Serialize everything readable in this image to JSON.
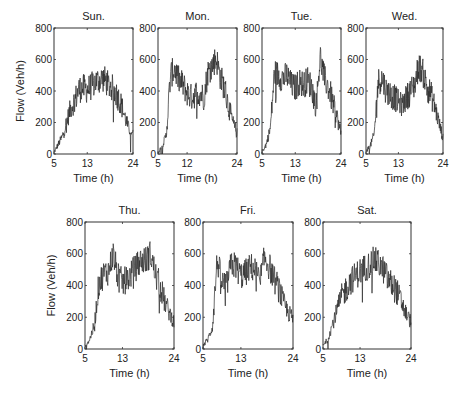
{
  "figure": {
    "ylabel": "Flow (Veh/h)",
    "xlabel": "Time (h)"
  },
  "chart_data": [
    {
      "type": "line",
      "title": "Sun.",
      "xlabel": "Time (h)",
      "ylabel": "Flow (Veh/h)",
      "xlim": [
        5,
        24
      ],
      "ylim": [
        0,
        800
      ],
      "xticks": [
        5,
        13,
        24
      ],
      "yticks": [
        0,
        200,
        400,
        600,
        800
      ],
      "grid": false,
      "x": [
        5,
        6,
        7,
        8,
        9,
        10,
        11,
        12,
        13,
        14,
        15,
        16,
        17,
        18,
        19,
        20,
        21,
        22,
        23,
        24
      ],
      "values": [
        10,
        60,
        110,
        200,
        290,
        340,
        410,
        420,
        410,
        430,
        460,
        470,
        480,
        440,
        420,
        380,
        330,
        240,
        160,
        140
      ]
    },
    {
      "type": "line",
      "title": "Mon.",
      "xlabel": "Time (h)",
      "ylabel": "",
      "xlim": [
        5,
        24
      ],
      "ylim": [
        0,
        800
      ],
      "xticks": [
        5,
        12,
        24
      ],
      "yticks": [
        0,
        200,
        400,
        600,
        800
      ],
      "grid": false,
      "x": [
        5,
        6,
        7,
        8,
        9,
        10,
        11,
        12,
        13,
        14,
        15,
        16,
        17,
        18,
        19,
        20,
        21,
        22,
        23,
        24
      ],
      "values": [
        10,
        50,
        120,
        500,
        540,
        470,
        440,
        390,
        360,
        380,
        390,
        360,
        520,
        560,
        610,
        490,
        420,
        300,
        200,
        130
      ]
    },
    {
      "type": "line",
      "title": "Tue.",
      "xlabel": "Time (h)",
      "ylabel": "",
      "xlim": [
        5,
        24
      ],
      "ylim": [
        0,
        800
      ],
      "xticks": [
        5,
        13,
        24
      ],
      "yticks": [
        0,
        200,
        400,
        600,
        800
      ],
      "grid": false,
      "x": [
        5,
        6,
        7,
        8,
        9,
        10,
        11,
        12,
        13,
        14,
        15,
        16,
        17,
        18,
        19,
        20,
        21,
        22,
        23,
        24
      ],
      "values": [
        15,
        60,
        160,
        520,
        500,
        480,
        500,
        440,
        420,
        460,
        440,
        470,
        420,
        300,
        620,
        480,
        420,
        330,
        240,
        130
      ]
    },
    {
      "type": "line",
      "title": "Wed.",
      "xlabel": "Time (h)",
      "ylabel": "",
      "xlim": [
        5,
        24
      ],
      "ylim": [
        0,
        800
      ],
      "xticks": [
        5,
        13,
        24
      ],
      "yticks": [
        0,
        200,
        400,
        600,
        800
      ],
      "grid": false,
      "x": [
        5,
        6,
        7,
        8,
        9,
        10,
        11,
        12,
        13,
        14,
        15,
        16,
        17,
        18,
        19,
        20,
        21,
        22,
        23,
        24
      ],
      "values": [
        20,
        50,
        120,
        460,
        480,
        400,
        380,
        360,
        330,
        310,
        360,
        400,
        440,
        560,
        520,
        430,
        380,
        300,
        200,
        100
      ]
    },
    {
      "type": "line",
      "title": "Thu.",
      "xlabel": "Time (h)",
      "ylabel": "Flow (Veh/h)",
      "xlim": [
        5,
        24
      ],
      "ylim": [
        0,
        800
      ],
      "xticks": [
        5,
        13,
        24
      ],
      "yticks": [
        0,
        200,
        400,
        600,
        800
      ],
      "grid": false,
      "x": [
        5,
        6,
        7,
        8,
        9,
        10,
        11,
        12,
        13,
        14,
        15,
        16,
        17,
        18,
        19,
        20,
        21,
        22,
        23,
        24
      ],
      "values": [
        20,
        60,
        150,
        420,
        470,
        490,
        600,
        460,
        420,
        440,
        480,
        520,
        560,
        560,
        600,
        470,
        400,
        300,
        230,
        170
      ]
    },
    {
      "type": "line",
      "title": "Fri.",
      "xlabel": "Time (h)",
      "ylabel": "",
      "xlim": [
        5,
        24
      ],
      "ylim": [
        0,
        800
      ],
      "xticks": [
        5,
        13,
        24
      ],
      "yticks": [
        0,
        200,
        400,
        600,
        800
      ],
      "grid": false,
      "x": [
        5,
        6,
        7,
        8,
        9,
        10,
        11,
        12,
        13,
        14,
        15,
        16,
        17,
        18,
        19,
        20,
        21,
        22,
        23,
        24
      ],
      "values": [
        20,
        60,
        140,
        560,
        420,
        400,
        540,
        520,
        460,
        480,
        520,
        500,
        420,
        580,
        520,
        440,
        380,
        290,
        230,
        190
      ]
    },
    {
      "type": "line",
      "title": "Sat.",
      "xlabel": "Time (h)",
      "ylabel": "",
      "xlim": [
        5,
        24
      ],
      "ylim": [
        0,
        800
      ],
      "xticks": [
        5,
        13,
        24
      ],
      "yticks": [
        0,
        200,
        400,
        600,
        800
      ],
      "grid": false,
      "x": [
        5,
        6,
        7,
        8,
        9,
        10,
        11,
        12,
        13,
        14,
        15,
        16,
        17,
        18,
        19,
        20,
        21,
        22,
        23,
        24
      ],
      "values": [
        20,
        60,
        150,
        240,
        330,
        380,
        430,
        460,
        490,
        510,
        530,
        560,
        540,
        500,
        440,
        400,
        360,
        290,
        220,
        170
      ]
    }
  ],
  "layout": {
    "panels": [
      {
        "left": 54,
        "top": 28,
        "right": 133,
        "bottom": 154
      },
      {
        "left": 158,
        "top": 28,
        "right": 237,
        "bottom": 154
      },
      {
        "left": 262,
        "top": 28,
        "right": 341,
        "bottom": 154
      },
      {
        "left": 366,
        "top": 28,
        "right": 443,
        "bottom": 154
      },
      {
        "left": 85,
        "top": 222,
        "right": 174,
        "bottom": 349
      },
      {
        "left": 203,
        "top": 222,
        "right": 293,
        "bottom": 349
      },
      {
        "left": 323,
        "top": 222,
        "right": 411,
        "bottom": 349
      }
    ],
    "ylabel_x": [
      22,
      53
    ],
    "ylabel_y": [
      91,
      286
    ]
  }
}
